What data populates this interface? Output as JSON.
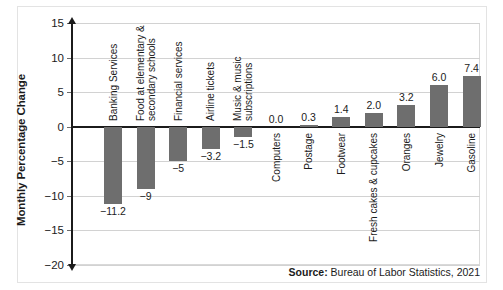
{
  "chart_data": {
    "type": "bar",
    "title": "",
    "xlabel": "",
    "ylabel": "Monthly Percentage Change",
    "ylim": [
      -20,
      15
    ],
    "yticks": [
      15,
      10,
      5,
      0,
      -5,
      -10,
      -15,
      -20
    ],
    "ytick_labels": [
      "15",
      "10",
      "5",
      "0",
      "−5",
      "−10",
      "−15",
      "−20"
    ],
    "grid": true,
    "legend": "none",
    "categories": [
      "Banking Services",
      "Food at elementary & secondary schools",
      "Financial services",
      "Airline tickets",
      "Music & music subscriptions",
      "Computers",
      "Postage",
      "Footwear",
      "Fresh cakes & cupcakes",
      "Oranges",
      "Jewelry",
      "Gasoline"
    ],
    "category_lines": [
      [
        "Banking Services"
      ],
      [
        "Food at elementary &",
        "secondary schools"
      ],
      [
        "Financial services"
      ],
      [
        "Airline tickets"
      ],
      [
        "Music & music",
        "subscriptions"
      ],
      [
        "Computers"
      ],
      [
        "Postage"
      ],
      [
        "Footwear"
      ],
      [
        "Fresh cakes & cupcakes"
      ],
      [
        "Oranges"
      ],
      [
        "Jewelry"
      ],
      [
        "Gasoline"
      ]
    ],
    "values": [
      -11.2,
      -9,
      -5,
      -3.2,
      -1.5,
      0.0,
      0.3,
      1.4,
      2.0,
      3.2,
      6.0,
      7.4
    ],
    "value_labels": [
      "−11.2",
      "−9",
      "−5",
      "−3.2",
      "−1.5",
      "0.0",
      "0.3",
      "1.4",
      "2.0",
      "3.2",
      "6.0",
      "7.4"
    ],
    "bar_color": "#6e6e6e",
    "axis_color": "#1b1b1b",
    "grid_color": "#d2d2d2"
  },
  "source": {
    "prefix": "Source:",
    "text": "Bureau of Labor Statistics, 2021"
  }
}
